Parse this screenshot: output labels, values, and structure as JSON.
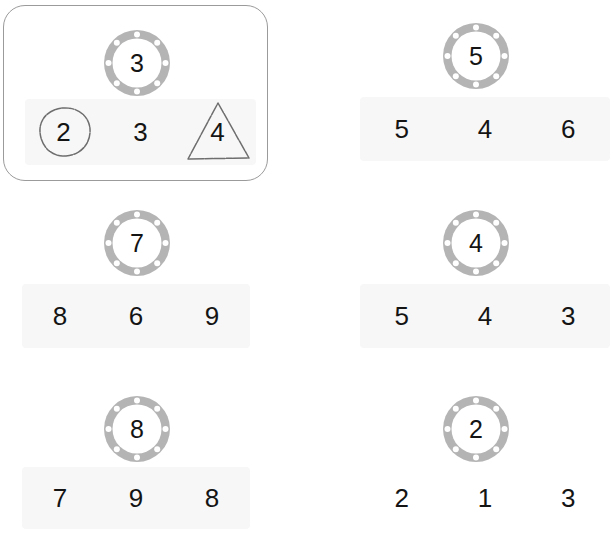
{
  "page": {
    "background_color": "#ffffff",
    "band_color": "#f7f7f7",
    "ring_color": "#b4b4b4",
    "text_color": "#141414",
    "active_border_color": "#9b9b9b",
    "pencil_color": "#6e6e6e"
  },
  "questions": [
    {
      "id": "q1",
      "active": true,
      "prompt_icon": "gasket-ring-icon",
      "prompt_value": "3",
      "choices": [
        "2",
        "3",
        "4"
      ],
      "annotations": [
        {
          "choice_index": 0,
          "shape": "hand-drawn-circle",
          "value": "2"
        },
        {
          "choice_index": 2,
          "shape": "hand-drawn-triangle",
          "value": "4"
        }
      ]
    },
    {
      "id": "q2",
      "active": false,
      "prompt_icon": "gasket-ring-icon",
      "prompt_value": "5",
      "choices": [
        "5",
        "4",
        "6"
      ],
      "annotations": []
    },
    {
      "id": "q3",
      "active": false,
      "prompt_icon": "gasket-ring-icon",
      "prompt_value": "7",
      "choices": [
        "8",
        "6",
        "9"
      ],
      "annotations": []
    },
    {
      "id": "q4",
      "active": false,
      "prompt_icon": "gasket-ring-icon",
      "prompt_value": "4",
      "choices": [
        "5",
        "4",
        "3"
      ],
      "annotations": []
    },
    {
      "id": "q5",
      "active": false,
      "prompt_icon": "gasket-ring-icon",
      "prompt_value": "8",
      "choices": [
        "7",
        "9",
        "8"
      ],
      "annotations": []
    },
    {
      "id": "q6",
      "active": false,
      "prompt_icon": "gasket-ring-icon",
      "prompt_value": "2",
      "choices": [
        "2",
        "1",
        "3"
      ],
      "annotations": []
    }
  ]
}
